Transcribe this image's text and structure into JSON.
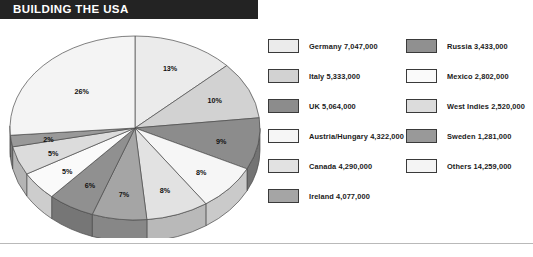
{
  "header": {
    "title": "BUILDING THE USA",
    "banner_color": "#232323",
    "text_color": "#ffffff"
  },
  "chart_data": {
    "type": "pie",
    "title": "BUILDING THE USA",
    "xlabel": "",
    "ylabel": "",
    "three_d": true,
    "legend_position": "right",
    "grid": false,
    "value_unit": "immigrants",
    "total": 56358000,
    "categories": [
      "Germany",
      "Italy",
      "UK",
      "Austria/Hungary",
      "Canada",
      "Ireland",
      "Russia",
      "Mexico",
      "West Indies",
      "Sweden",
      "Others"
    ],
    "values": [
      7047000,
      5333000,
      5064000,
      4322000,
      4290000,
      4077000,
      3433000,
      2802000,
      2520000,
      1281000,
      14259000
    ],
    "value_labels": [
      "7,047,000",
      "5,333,000",
      "5,064,000",
      "4,322,000",
      "4,290,000",
      "4,077,000",
      "3,433,000",
      "2,802,000",
      "2,520,000",
      "1,281,000",
      "14,259,000"
    ],
    "percent_labels": [
      "13%",
      "10%",
      "9%",
      "8%",
      "8%",
      "7%",
      "6%",
      "5%",
      "5%",
      "2%",
      "26%"
    ],
    "percents": [
      13,
      10,
      9,
      8,
      8,
      7,
      6,
      5,
      5,
      2,
      26
    ],
    "slice_colors": [
      "#ebebeb",
      "#d2d2d2",
      "#8c8c8c",
      "#f6f6f6",
      "#e2e2e2",
      "#a5a5a5",
      "#909090",
      "#fafafa",
      "#dcdcdc",
      "#999999",
      "#f4f4f4"
    ]
  },
  "pie_labels": {
    "germany": "13%",
    "italy": "10%",
    "uk": "9%",
    "austria_hungary": "8%",
    "canada": "8%",
    "ireland": "7%",
    "russia": "6%",
    "mexico": "5%",
    "west_indies": "5%",
    "sweden": "2%",
    "others": "26%"
  },
  "legend": {
    "left_column": [
      {
        "label": "Germany 7,047,000",
        "swatch": "#ebebeb"
      },
      {
        "label": "Italy 5,333,000",
        "swatch": "#d2d2d2"
      },
      {
        "label": "UK 5,064,000",
        "swatch": "#8c8c8c"
      },
      {
        "label": "Austria/Hungary 4,322,000",
        "swatch": "#f6f6f6"
      },
      {
        "label": "Canada 4,290,000",
        "swatch": "#e2e2e2"
      },
      {
        "label": "Ireland 4,077,000",
        "swatch": "#a5a5a5"
      }
    ],
    "right_column": [
      {
        "label": "Russia 3,433,000",
        "swatch": "#909090"
      },
      {
        "label": "Mexico 2,802,000",
        "swatch": "#fafafa"
      },
      {
        "label": "West Indies 2,520,000",
        "swatch": "#dcdcdc"
      },
      {
        "label": "Sweden 1,281,000",
        "swatch": "#999999"
      },
      {
        "label": "Others 14,259,000",
        "swatch": "#f4f4f4"
      }
    ]
  }
}
